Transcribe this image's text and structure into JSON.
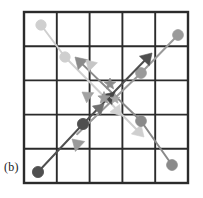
{
  "figure": {
    "caption_label": "(b)",
    "background_color": "#ffffff",
    "grid": {
      "name": "5x5-grid",
      "rows": 5,
      "columns": 5,
      "x0": 24,
      "y0": 12,
      "x1": 188,
      "y1": 183,
      "cell_width": 32.8,
      "cell_height": 34.2,
      "line_color": "#2b2b2b",
      "outer_line_width": 2.4,
      "inner_line_width": 1.9
    },
    "chart_data": {
      "type": "scatter",
      "title": "",
      "xlabel": "",
      "ylabel": "",
      "xlim": [
        0,
        5
      ],
      "ylim": [
        0,
        5
      ],
      "grid": true,
      "legend": "none",
      "description": "Four directional trajectories crossing a 5x5 grid; each trajectory is a polyline of round waypoint markers ending in an arrowhead, with star markers clustered near the grid center.",
      "series": [
        {
          "name": "trajectory-1",
          "color": "#cfcfcf",
          "direction": "down-right",
          "points": [
            [
              41,
              25
            ],
            [
              65,
              57
            ],
            [
              144,
              137
            ]
          ],
          "markers": [
            {
              "shape": "circle",
              "x": 41,
              "y": 25,
              "r": 5.2
            },
            {
              "shape": "circle",
              "x": 65,
              "y": 57,
              "r": 5.2
            }
          ],
          "arrow": {
            "x": 144,
            "y": 137,
            "angle": 45
          }
        },
        {
          "name": "trajectory-2",
          "color": "#9a9a9a",
          "direction": "down-left",
          "points": [
            [
              178,
              35
            ],
            [
              141,
              73
            ],
            [
              72,
              139
            ]
          ],
          "markers": [
            {
              "shape": "circle",
              "x": 178,
              "y": 35,
              "r": 5.4
            },
            {
              "shape": "circle",
              "x": 141,
              "y": 73,
              "r": 5.4
            }
          ],
          "arrow": {
            "x": 72,
            "y": 139,
            "angle": 223
          }
        },
        {
          "name": "trajectory-3",
          "color": "#8a8a8a",
          "direction": "up-left",
          "points": [
            [
              172,
              165
            ],
            [
              141,
              121
            ],
            [
              75,
              57
            ]
          ],
          "markers": [
            {
              "shape": "circle",
              "x": 172,
              "y": 165,
              "r": 5.4
            },
            {
              "shape": "circle",
              "x": 141,
              "y": 121,
              "r": 5.4
            }
          ],
          "arrow": {
            "x": 75,
            "y": 57,
            "angle": 224
          }
        },
        {
          "name": "trajectory-4",
          "color": "#4f4f4f",
          "direction": "up-right",
          "points": [
            [
              38,
              172
            ],
            [
              83,
              124
            ],
            [
              152,
              53
            ]
          ],
          "markers": [
            {
              "shape": "circle",
              "x": 38,
              "y": 172,
              "r": 5.6
            },
            {
              "shape": "circle",
              "x": 83,
              "y": 124,
              "r": 5.6
            }
          ],
          "arrow": {
            "x": 152,
            "y": 53,
            "angle": -46
          }
        }
      ],
      "extra_arrows": [
        {
          "name": "arrow-up-left-light",
          "color": "#c6c6c6",
          "x": 86,
          "y": 60,
          "angle": 225,
          "size": 10
        },
        {
          "name": "arrow-down-left-mid",
          "color": "#a2a2a2",
          "x": 82,
          "y": 92,
          "angle": 215,
          "size": 10
        },
        {
          "name": "arrow-up-right-dark",
          "color": "#454545",
          "x": 115,
          "y": 92,
          "angle": -44,
          "size": 11
        },
        {
          "name": "arrow-down-right-light",
          "color": "#d2d2d2",
          "x": 121,
          "y": 116,
          "angle": 52,
          "size": 10
        },
        {
          "name": "arrow-up-right-mid",
          "color": "#6f6f6f",
          "x": 104,
          "y": 104,
          "angle": -42,
          "size": 10
        }
      ],
      "stars": [
        {
          "name": "star-marker-1",
          "color": "#8d8d8d",
          "x": 110,
          "y": 84,
          "r": 6.0
        },
        {
          "name": "star-marker-2",
          "color": "#9b9b9b",
          "x": 104,
          "y": 98,
          "r": 6.4
        },
        {
          "name": "star-marker-3",
          "color": "#a8a8a8",
          "x": 115,
          "y": 99,
          "r": 5.2
        }
      ]
    }
  }
}
